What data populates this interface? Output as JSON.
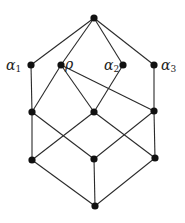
{
  "diagram": {
    "type": "hasse-diagram",
    "colors": {
      "edge": "#2a2a2a",
      "node": "#111111",
      "background": "#ffffff"
    },
    "nodes": [
      {
        "id": "top",
        "x": 94,
        "y": 18,
        "label": ""
      },
      {
        "id": "a1",
        "x": 31,
        "y": 65,
        "label": "α",
        "sub": "1",
        "lx": 6,
        "ly": 70
      },
      {
        "id": "rho",
        "x": 61,
        "y": 65,
        "label": "ρ",
        "sub": "",
        "lx": 65,
        "ly": 69
      },
      {
        "id": "a2",
        "x": 123,
        "y": 65,
        "label": "α",
        "sub": "2",
        "lx": 104,
        "ly": 70
      },
      {
        "id": "a3",
        "x": 154,
        "y": 65,
        "label": "α",
        "sub": "3",
        "lx": 161,
        "ly": 70
      },
      {
        "id": "m1",
        "x": 32,
        "y": 112,
        "label": ""
      },
      {
        "id": "m2",
        "x": 94,
        "y": 112,
        "label": ""
      },
      {
        "id": "m3",
        "x": 154,
        "y": 111,
        "label": ""
      },
      {
        "id": "l1",
        "x": 32,
        "y": 160,
        "label": ""
      },
      {
        "id": "l2",
        "x": 94,
        "y": 159,
        "label": ""
      },
      {
        "id": "l3",
        "x": 155,
        "y": 158,
        "label": ""
      },
      {
        "id": "bot",
        "x": 95,
        "y": 206,
        "label": ""
      }
    ],
    "edges": [
      [
        "top",
        "a1"
      ],
      [
        "top",
        "rho"
      ],
      [
        "top",
        "a2"
      ],
      [
        "top",
        "a3"
      ],
      [
        "a1",
        "m1"
      ],
      [
        "rho",
        "m1"
      ],
      [
        "rho",
        "m2"
      ],
      [
        "rho",
        "m3"
      ],
      [
        "a2",
        "m2"
      ],
      [
        "a3",
        "m3"
      ],
      [
        "m1",
        "l1"
      ],
      [
        "m1",
        "l2"
      ],
      [
        "m2",
        "l1"
      ],
      [
        "m2",
        "l3"
      ],
      [
        "m3",
        "l2"
      ],
      [
        "m3",
        "l3"
      ],
      [
        "l1",
        "bot"
      ],
      [
        "l2",
        "bot"
      ],
      [
        "l3",
        "bot"
      ]
    ]
  }
}
